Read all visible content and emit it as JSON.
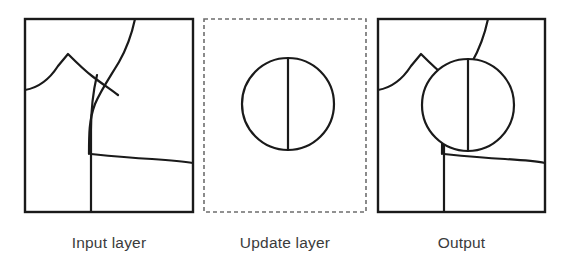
{
  "figure": {
    "type": "diagram",
    "background": "#ffffff",
    "stroke_color": "#1a1a1a",
    "label_color": "#3b3b3b",
    "panels": [
      {
        "id": "input",
        "label": "Input layer",
        "border_style": "solid",
        "x": 25,
        "y": 19,
        "width": 168,
        "height": 193
      },
      {
        "id": "update",
        "label": "Update layer",
        "border_style": "dashed",
        "x": 204,
        "y": 19,
        "width": 162,
        "height": 193
      },
      {
        "id": "output",
        "label": "Output",
        "border_style": "solid",
        "x": 378,
        "y": 19,
        "width": 167,
        "height": 193
      }
    ],
    "update_circle": {
      "center_x": 288,
      "center_y": 104,
      "radius": 46,
      "diameter_line": "vertical"
    },
    "output_circle": {
      "center_x": 468,
      "center_y": 105,
      "radius": 46,
      "diameter_line": "vertical"
    },
    "input_curves": [
      {
        "name": "peak-curve",
        "path": "M 25,90 C 37,88 49,80 58,66 L 68,54 C 76,62 84,70 92,76 C 101,83 110,89 118,95"
      },
      {
        "name": "diagonal-curve",
        "path": "M 135,19 C 132,33 127,48 119,62 C 110,77 101,90 95,104 C 89,120 89,134 89,154"
      },
      {
        "name": "vertical-curve",
        "path": "M 97,75 C 93,92 91,110 91,130 L 91,212"
      },
      {
        "name": "baseline-curve",
        "path": "M 91,154 C 110,156 132,158 152,159 C 168,160 182,161 193,163"
      }
    ]
  }
}
